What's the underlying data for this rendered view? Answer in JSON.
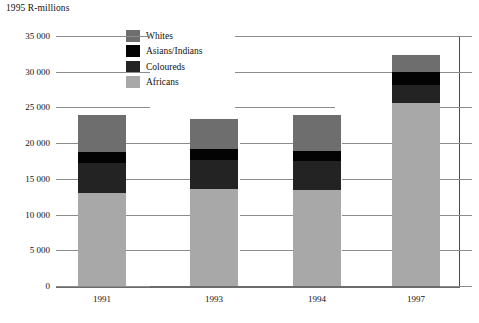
{
  "chart_data": {
    "type": "bar",
    "subtype": "stacked",
    "title": "1995 R-millions",
    "xlabel": "",
    "ylabel": "1995 R-millions",
    "categories": [
      "1991",
      "1993",
      "1994",
      "1997"
    ],
    "ylim": [
      0,
      35000
    ],
    "yticks": [
      0,
      5000,
      10000,
      15000,
      20000,
      25000,
      30000,
      35000
    ],
    "ytick_labels": [
      "0",
      "5 000",
      "10 000",
      "15 000",
      "20 000",
      "25 000",
      "30 000",
      "35 000"
    ],
    "grid": true,
    "legend_position": "top-center",
    "series": [
      {
        "name": "Africans",
        "color": "#a8a8a8",
        "values": [
          13000,
          13600,
          13400,
          25600
        ]
      },
      {
        "name": "Coloureds",
        "color": "#232323",
        "values": [
          4200,
          4000,
          4100,
          2500
        ]
      },
      {
        "name": "Asians/Indians",
        "color": "#030303",
        "values": [
          1550,
          1550,
          1400,
          1800
        ]
      },
      {
        "name": "Whites",
        "color": "#6e6e6e",
        "values": [
          5150,
          4250,
          5000,
          2400
        ]
      }
    ],
    "totals": [
      23900,
      23400,
      23900,
      32300
    ]
  },
  "legend": {
    "items": [
      {
        "label": "Whites",
        "color": "#6e6e6e"
      },
      {
        "label": "Asians/Indians",
        "color": "#030303"
      },
      {
        "label": "Coloureds",
        "color": "#232323"
      },
      {
        "label": "Africans",
        "color": "#a8a8a8"
      }
    ]
  },
  "axis": {
    "title": "1995 R-millions"
  }
}
